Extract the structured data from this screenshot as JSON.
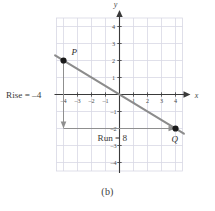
{
  "figure": {
    "caption": "(b)",
    "axis_labels": {
      "x": "x",
      "y": "y"
    },
    "annotations": {
      "rise": "Rise = –4",
      "run": "Run = 8"
    },
    "points": [
      {
        "label": "P",
        "x": -4,
        "y": 2
      },
      {
        "label": "Q",
        "x": 4,
        "y": -2
      }
    ]
  },
  "chart_data": {
    "type": "line",
    "title": "",
    "subtitle": "",
    "xlabel": "x",
    "ylabel": "y",
    "xlim": [
      -4.5,
      4.5
    ],
    "ylim": [
      -4.5,
      4.5
    ],
    "xticks": [
      -4,
      -3,
      -2,
      -1,
      1,
      2,
      3,
      4
    ],
    "yticks": [
      -4,
      -3,
      -2,
      -1,
      1,
      2,
      3,
      4
    ],
    "xticklabels": [
      "–4",
      "–3",
      "–2",
      "–1",
      "1",
      "2",
      "3",
      "4"
    ],
    "yticklabels": [
      "–4",
      "–3",
      "–2",
      "–1",
      "1",
      "2",
      "3",
      "4"
    ],
    "grid": true,
    "grid_spacing": 1,
    "legend": false,
    "legend_position": "none",
    "series": [
      {
        "name": "line through P and Q",
        "type": "line",
        "x": [
          -4.6,
          4.6
        ],
        "y": [
          2.3,
          -2.3
        ],
        "slope": -0.5,
        "intercept": 0,
        "color": "#8c8c8c"
      }
    ],
    "points": [
      {
        "name": "P",
        "x": -4,
        "y": 2,
        "marker": "filled-circle",
        "color": "#1a1a1a"
      },
      {
        "name": "Q",
        "x": 4,
        "y": -2,
        "marker": "filled-circle",
        "color": "#1a1a1a"
      }
    ],
    "annotations": [
      {
        "name": "rise",
        "text": "Rise = –4",
        "kind": "arrow",
        "from": [
          -4,
          2
        ],
        "to": [
          -4,
          -2
        ],
        "value": -4,
        "orientation": "vertical"
      },
      {
        "name": "run",
        "text": "Run = 8",
        "kind": "arrow",
        "from": [
          -4,
          -2
        ],
        "to": [
          4,
          -2
        ],
        "value": 8,
        "orientation": "horizontal"
      }
    ]
  },
  "colors": {
    "grid": "#d8d8e4",
    "axis": "#3a3a3a",
    "line": "#8c8c8c",
    "annotation": "#7d7d7d",
    "point": "#1a1a1a",
    "text": "#3b3b3b",
    "background": "#ffffff"
  }
}
